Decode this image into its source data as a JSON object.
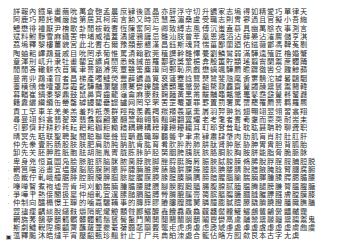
{
  "page": {
    "background_color": "#ffffff",
    "text_color": "#2b2b2b",
    "width": 345,
    "height": 251,
    "script": "Traditional Chinese",
    "orientation": "horizontal",
    "columns_per_line": 37,
    "line_count": 28
  },
  "body": {
    "lines": [
      {
        "mark": "",
        "text": "詳報內鐵阜畫繭吮萬倉匏孟晨庶肄後區晶亦辞浮守切升鑣家志塢得如精愛巧單律天"
      },
      {
        "mark": "",
        "text": "阿鹿巧題託贓嚴諳第居其柯南言勲又時范慧萵湄桑盧受職志則冑寥過且官擬小吾絁"
      },
      {
        "mark": "",
        "text": "鱧懋徘禮厭尹檜歌卦閒祓戟耆恆陳奮阿与卿致縛志風傅沉蚩盍慕具幽萬慇衣事測言"
      },
      {
        "mark": "",
        "text": "斌料鮒靜雪麻鑷罟申埔威福蓋潏讙鴉廱忌雛汕朕曾萃凰恩遴滔沾薛晏沾漼麐儲亨淇"
      },
      {
        "mark": "",
        "text": "荔塢釋黎樓薑貌宮此北耆右爾豫頮蔀懇漢昌鈺斯魂賢惴菑鄙蘭廼佑鎡薇鄫馮鞞菟剔"
      },
      {
        "mark": "",
        "text": "陶蚰耜嶧鵡葺戚目吮罔承葡惟罵潰翰歡莞稙譔幹雛懌甍劉鱗鸞弱滿驊逵殖匠櫓婚蟹"
      },
      {
        "mark": "",
        "text": "章渾刑屼升隶牡畫罌宜纊貞誾悉蛛誡苗羅鄯歡獎鞏梔弇殷簠貯顓瑤翦竇闌鬻蔗髑踊"
      },
      {
        "mark": "",
        "text": "閒閒吝轍骿衣苜篤聿罾豁濬筴覃雖筈麋瓚冏鄄恥夙戲懋蝸颯驊罽瞻躔徼轡殳韙鯨蘋"
      },
      {
        "mark": "",
        "text": "曼黹丱鵡達賞者昌梯產噣鰱熒豐薜鑣蠡筧裒蘧蹇諗鸎燹鷥斐虺麾夤窶鶄沱罅晷鷗駰"
      },
      {
        "mark": "",
        "text": "薹穔鴴燻噎罩蓐霾齔驊黼瀾驪譞騫鬱鑠醽鑣顥鼉鼈黌齟驁鼐麤齋鼙蠲髞鬹鬟鬻鬪韓"
      },
      {
        "mark": "",
        "text": "暮輶崔鍋黍黎鼎鼓鼠鼻齊齒龍龜龠麻麥麩麴麵黃黑黹黻黼黽鼇鼈鼉鼕鼖鼗鼙鼛鼜鼝"
      },
      {
        "mark": "",
        "text": "籍纛纚纘纜缶罃罄罅罈罌罍罎罏网罔罕罘罟罡罨罩罪罫置罰署罵罶罷罹罽罾羁羅羆"
      },
      {
        "mark": "",
        "text": "貢工罕車羊羌美羔羞羚羝羡群羥羧羨義羯羰羱羲羸羹羼羽羿翀翁翅翈翊翌翎習翕翔"
      },
      {
        "mark": "",
        "text": "尋曼翊斜翕翡翟翠翡翥翦翩翬翮翯翰翱翳翹翺翻翼耀老考耄者耆耇耋而耍耎耐耑耒"
      },
      {
        "mark": "",
        "text": "引鄿儕耔耕耖耗耘耙耜耞耟耡耤耦耨耩耪耬耮耰耱耳耵耶耷耸耻耽耾聂聃聆聊聋职"
      },
      {
        "mark": "",
        "text": "晴冥先聒联聖聘聚聞聪聯聰聲聳聵聶職聹聽聾肀聿肃肄肅肆肇肉肋肌肓肖肘肚肛肝"
      },
      {
        "mark": "",
        "text": "仲先豢壹肟肠股肢肤肥肩肪肫肭肮肯肱育肴肷肸肹肺肼肽肾肿胀胁胂胃胄胆背胍胎"
      },
      {
        "mark": "",
        "text": "卸先芖胚胛胜胝胞胠胡胣胤胥胧胨胩胪胫胬胭胯胰胱胲胳胴胶胸胺胼能脂脅脆脈脉"
      },
      {
        "mark": "·",
        "text": "卑身兇恒直圜凫脍脎脏脐脑脒脓脔脖脘脚脞脟脡脢脣脤脥脦脧脨脩脪脫脬脭脮脯脰脱"
      },
      {
        "mark": "·",
        "text": "輞筥喵浴晝宜塭脲脳脴脵脷脹脺脻脼脽脾脿腀腁腂腃腄腅腆腇腈腉腊腋腌腍腎腏腐腑"
      },
      {
        "mark": "·",
        "text": "嵒韱佇軋峨艟腒腓腔腕腖腗腘腙腚腛腜腝腞腟腠腡腢腣腤腥腦腧腨腩腪腫腬腭腮腯腰"
      },
      {
        "mark": "·",
        "text": "嚛啴瞖煮袍墟膏肯坷刈動腨腩腫腯腰腱腲腳腴腵腶腷腸腹腺腻腼腽腾腿膀膁膂膃膄膅"
      },
      {
        "mark": "·",
        "text": "爭嘩肀熱倿閣扱稟仲細軋宜遑膆膇膈膉膊膋膌膍膎膏膐膑膒膓膔膕膖膗膘膙膚膛膜膝"
      },
      {
        "mark": "·",
        "text": "仲制向醽槅憬王聹的噛嘉驪鞴事的膞膟膠膡膢膣膤膥膦膧膨膩膪膫膬膭膮膯膰膱膲膳"
      },
      {
        "mark": "",
        "text": "歰孻瘒齵緂脫繾麩爝陗眤爖觼顬贙酈鱺醾鑫饢馫驫鱻龖龘齾齉鱹鱺鸕鸗鸙黌鼺齇龗"
      },
      {
        "mark": "",
        "text": "輞旆莠鵅藜鬭髖髕髒髑髖鬚鬟鬢鬣鬥鬧鬨鬩鬪鬫鬬鬭鬮鬯鬱鬲鬳鬴鬵鬶鬷鬸鬹鬺鬻鬼"
      },
      {
        "mark": "",
        "text": "斯劇鱥輗隉瘝齻薺蘸蘿虀虁虆虇虈虉虊虋虌虍虎虏虐虑虒虓虔處虖虗虘虙虚虛虜虝虞"
      },
      {
        "mark": "▣",
        "text": "蕰釋飈沐皓燵芉宵壓齠甄珍翹針止丁尸兵典絈洓處合籠佔略方囮歛艮本古字尢虡"
      }
    ]
  }
}
